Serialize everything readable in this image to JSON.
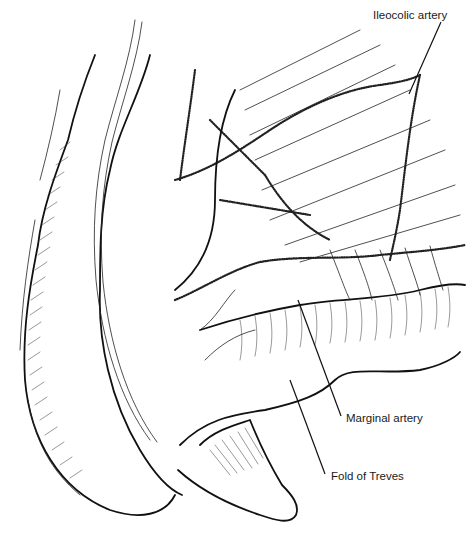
{
  "figure": {
    "type": "anatomical illustration",
    "style": "black ink line drawing",
    "background": "#ffffff",
    "ink": "#111111"
  },
  "labels": [
    {
      "id": "ileocolic",
      "text": "Ileocolic artery",
      "x": 373,
      "y": 7,
      "leader": {
        "x1": 441,
        "y1": 22,
        "x2": 409,
        "y2": 94
      }
    },
    {
      "id": "marginal",
      "text": "Marginal artery",
      "x": 347,
      "y": 410,
      "leader": {
        "x1": 341,
        "y1": 416,
        "x2": 298,
        "y2": 300
      }
    },
    {
      "id": "treves",
      "text": "Fold of Treves",
      "x": 331,
      "y": 468,
      "leader": {
        "x1": 325,
        "y1": 474,
        "x2": 290,
        "y2": 380
      }
    }
  ]
}
